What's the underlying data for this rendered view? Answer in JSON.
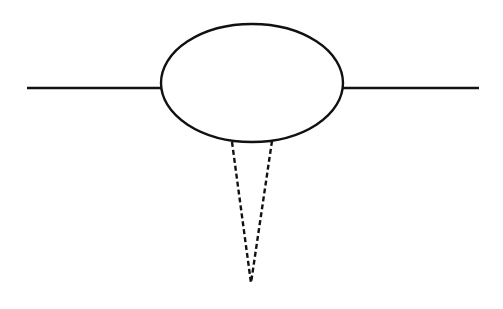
{
  "diagram": {
    "type": "feynman-like-loop-diagram",
    "background": "#ffffff",
    "stroke_color": "#111111",
    "stroke_width": 2.4,
    "dash_width": 2.4,
    "dash_pattern": "5,3",
    "elements": {
      "left_line": {
        "x1": 27,
        "y1": 88,
        "x2": 161,
        "y2": 88,
        "style": "solid"
      },
      "right_line": {
        "x1": 343,
        "y1": 88,
        "x2": 479,
        "y2": 88,
        "style": "solid"
      },
      "ellipse": {
        "cx": 252,
        "cy": 83,
        "rx": 91,
        "ry": 59,
        "style": "solid"
      },
      "dashed_left": {
        "x1": 232,
        "y1": 142,
        "x2": 251,
        "y2": 283,
        "style": "dashed"
      },
      "dashed_right": {
        "x1": 272,
        "y1": 141,
        "x2": 251,
        "y2": 283,
        "style": "dashed"
      }
    }
  }
}
